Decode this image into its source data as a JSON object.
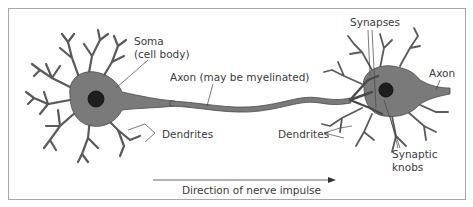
{
  "diagram": {
    "labels": {
      "soma_line1": "Soma",
      "soma_line2": "(cell body)",
      "axon_myelinated": "Axon (may be myelinated)",
      "dendrites_left": "Dendrites",
      "synapses": "Synapses",
      "axon_right": "Axon",
      "dendrites_right": "Dendrites",
      "synaptic_line1": "Synaptic",
      "synaptic_line2": "knobs",
      "direction": "Direction of nerve impulse"
    },
    "colors": {
      "cell_fill": "#7a7a7a",
      "cell_outline": "#4a4a4a",
      "nucleus": "#1e1e1e",
      "leader_line": "#444444",
      "frame_border": "#a8a8a8",
      "text": "#3a3a3a"
    }
  }
}
